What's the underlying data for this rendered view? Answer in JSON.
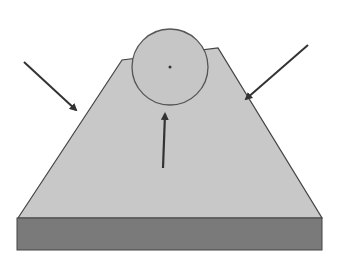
{
  "diagram": {
    "title": "",
    "colors": {
      "background": "#ffffff",
      "triangle_fill": "#c8c8c8",
      "circle_fill": "#c6c6c6",
      "outline": "#444444",
      "base_fill": "#7a7a7a",
      "arrow": "#333333"
    },
    "shapes": {
      "triangle": {
        "points": "18,218 122,60 218,48 322,218"
      },
      "circle": {
        "cx": 170,
        "cy": 67,
        "r": 38
      },
      "center_dot": {
        "cx": 170,
        "cy": 67,
        "r": 1.5
      },
      "base_slab": {
        "x": 17,
        "y": 218,
        "width": 305,
        "height": 32
      }
    },
    "arrows": [
      {
        "name": "left-force-arrow",
        "x1": 24,
        "y1": 62,
        "x2": 76,
        "y2": 110
      },
      {
        "name": "right-force-arrow",
        "x1": 308,
        "y1": 45,
        "x2": 246,
        "y2": 99
      },
      {
        "name": "upward-force-arrow",
        "x1": 163,
        "y1": 168,
        "x2": 165,
        "y2": 114
      }
    ]
  }
}
